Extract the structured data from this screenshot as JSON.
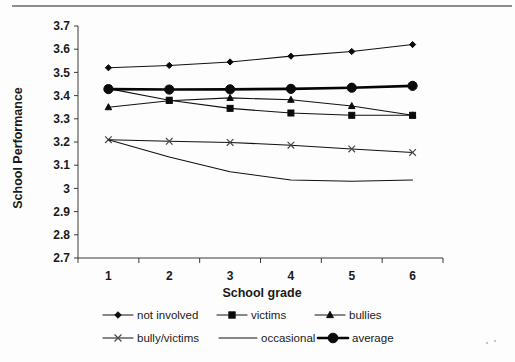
{
  "chart_data": {
    "type": "line",
    "title": "",
    "xlabel": "School grade",
    "ylabel": "School Performance",
    "categories": [
      "1",
      "2",
      "3",
      "4",
      "5",
      "6"
    ],
    "x": [
      1,
      2,
      3,
      4,
      5,
      6
    ],
    "ylim": [
      2.7,
      3.7
    ],
    "ytick_labels": [
      "3.7",
      "3.6",
      "3.5",
      "3.4",
      "3.3",
      "3.2",
      "3.1",
      "3",
      "2.9",
      "2.8",
      "2.7"
    ],
    "ytick_values": [
      3.7,
      3.6,
      3.5,
      3.4,
      3.3,
      3.2,
      3.1,
      3.0,
      2.9,
      2.8,
      2.7
    ],
    "grid": false,
    "legend_position": "bottom",
    "series": [
      {
        "name": "not involved",
        "marker": "diamond",
        "line_weight": "thin",
        "values": [
          3.52,
          3.53,
          3.545,
          3.57,
          3.59,
          3.62
        ]
      },
      {
        "name": "victims",
        "marker": "square",
        "line_weight": "thin",
        "values": [
          3.43,
          3.38,
          3.345,
          3.325,
          3.315,
          3.315
        ]
      },
      {
        "name": "bullies",
        "marker": "triangle",
        "line_weight": "thin",
        "values": [
          3.35,
          3.378,
          3.39,
          3.382,
          3.355,
          3.315
        ]
      },
      {
        "name": "bully/victims",
        "marker": "x",
        "line_weight": "thin",
        "values": [
          3.21,
          3.203,
          3.198,
          3.186,
          3.17,
          3.155
        ]
      },
      {
        "name": "occasional",
        "marker": "none",
        "line_weight": "thin",
        "values": [
          3.21,
          3.135,
          3.072,
          3.036,
          3.031,
          3.036
        ]
      },
      {
        "name": "average",
        "marker": "circle",
        "line_weight": "thick",
        "values": [
          3.428,
          3.426,
          3.427,
          3.429,
          3.434,
          3.442
        ]
      }
    ]
  },
  "legend": {
    "rows": [
      [
        "not involved",
        "victims",
        "bullies"
      ],
      [
        "bully/victims",
        "occasional",
        "average"
      ]
    ]
  },
  "colors": {
    "line": "#111111",
    "axis": "#3a3a3a",
    "text": "#1a1a1a",
    "background": "#fdfdfd",
    "rule": "#8d8d8d"
  }
}
